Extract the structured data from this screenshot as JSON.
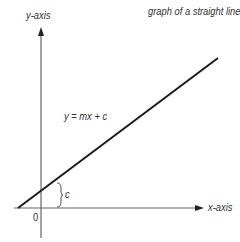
{
  "title": "graph of a straight line",
  "axes": {
    "y_label": "y-axis",
    "x_label": "x-axis",
    "origin_label": "0"
  },
  "line": {
    "equation": "y = mx + c",
    "intercept_label": "c"
  },
  "colors": {
    "line": "#1a1a1a",
    "axis": "#555555",
    "text": "#333333"
  }
}
